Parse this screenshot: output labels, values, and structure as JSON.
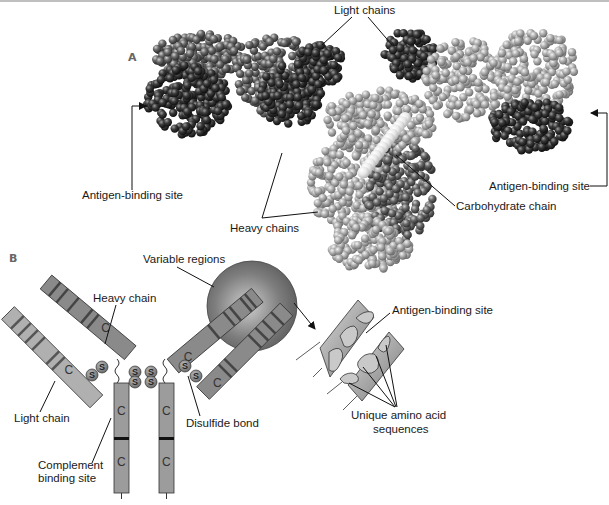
{
  "panels": {
    "a": {
      "label": "A"
    },
    "b": {
      "label": "B"
    }
  },
  "labels_a": {
    "light_chains": "Light chains",
    "antigen_binding_left": "Antigen-binding site",
    "antigen_binding_right": "Antigen-binding site",
    "heavy_chains": "Heavy chains",
    "carbohydrate_chain": "Carbohydrate chain"
  },
  "labels_b": {
    "variable_regions": "Variable regions",
    "heavy_chain": "Heavy chain",
    "light_chain": "Light chain",
    "disulfide_bond": "Disulfide bond",
    "complement_line1": "Complement",
    "complement_line2": "binding site",
    "antigen_binding_site": "Antigen-binding site",
    "unique_line1": "Unique amino acid",
    "unique_line2": "sequences"
  },
  "glyphs": {
    "constant": "C",
    "sulfur": "S"
  },
  "colors": {
    "dark_chain": "#2a2a2a",
    "mid_chain": "#5e5e5e",
    "light_chain_model": "#a8a8a8",
    "carbohydrate": "#e4e4e4",
    "heavy_bar": "#8c8c8c",
    "light_bar": "#b0b0b0",
    "variable_sphere": "#7a7a7a"
  }
}
